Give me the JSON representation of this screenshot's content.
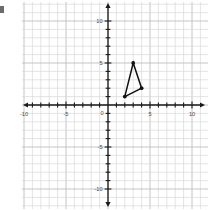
{
  "figure": {
    "title": "",
    "width": 209,
    "height": 210
  },
  "axis_labels": {
    "x": [
      "-10",
      "-5",
      "0",
      "5",
      "10"
    ],
    "y": [
      "10",
      "5",
      "-5",
      "-10"
    ],
    "origin": "0"
  },
  "chart_data": {
    "type": "scatter",
    "title": "",
    "xlabel": "",
    "ylabel": "",
    "xlim": [
      -10.8,
      11.2
    ],
    "ylim": [
      -11.2,
      11.5
    ],
    "xticks": [
      -10,
      -5,
      0,
      5,
      10
    ],
    "yticks": [
      10,
      5,
      0,
      -5,
      -10
    ],
    "xtick_labels": [
      "-10",
      "-5",
      "0",
      "5",
      "10"
    ],
    "ytick_labels": [
      "10",
      "5",
      "0",
      "-5",
      "-10"
    ],
    "grid": true,
    "grid_step": 1,
    "legend": "none",
    "annotations": [],
    "series": [
      {
        "name": "triangle",
        "kind": "polygon",
        "closed": true,
        "points": [
          {
            "label": "A",
            "x": 2,
            "y": 1
          },
          {
            "label": "B",
            "x": 3,
            "y": 5
          },
          {
            "label": "C",
            "x": 4,
            "y": 2
          }
        ],
        "marker": "filled-circle",
        "line_color": "#111111",
        "marker_color": "#111111"
      }
    ]
  },
  "colors": {
    "background": "#ffffff",
    "grid_minor": "#d8d8d8",
    "grid_major": "#bdbdbd",
    "axis": "#1a1a1a",
    "label": "#4a4a4a",
    "shape": "#111111"
  }
}
